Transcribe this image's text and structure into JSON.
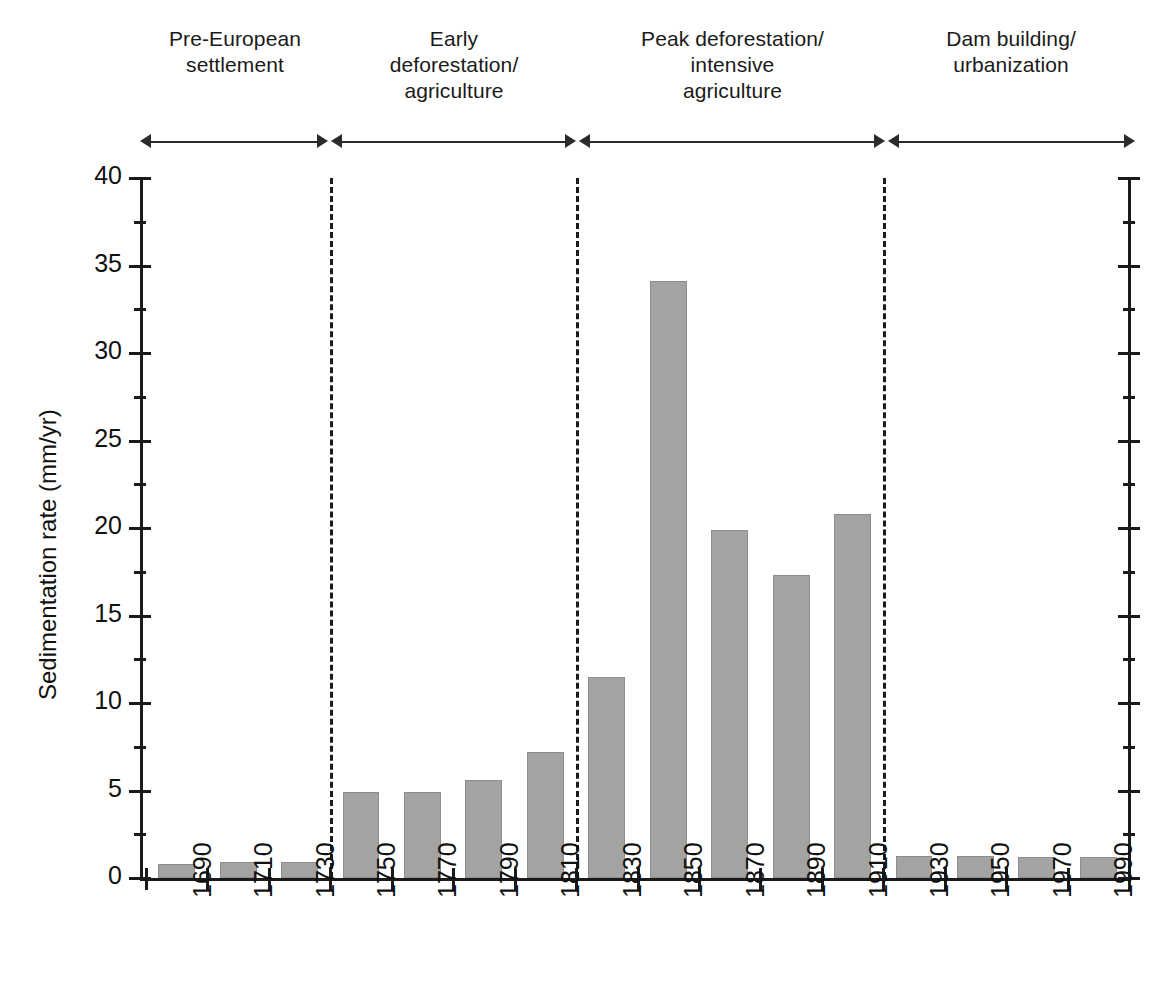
{
  "chart_data": {
    "type": "bar",
    "title": "",
    "xlabel": "",
    "ylabel": "Sedimentation rate (mm/yr)",
    "ylim": [
      0,
      40
    ],
    "ytick_values": [
      0,
      5,
      10,
      15,
      20,
      25,
      30,
      35,
      40
    ],
    "ytick_labels": [
      "0",
      "5",
      "10",
      "15",
      "20",
      "25",
      "30",
      "35",
      "40"
    ],
    "y_minor_tick_step": 2.5,
    "grid": false,
    "legend": null,
    "bar_color": "#a3a3a3",
    "categories": [
      "1690",
      "1710",
      "1730",
      "1750",
      "1770",
      "1790",
      "1810",
      "1830",
      "1850",
      "1870",
      "1890",
      "1910",
      "1930",
      "1950",
      "1970",
      "1990"
    ],
    "values": [
      0.8,
      0.9,
      0.9,
      4.9,
      4.9,
      5.6,
      7.2,
      11.5,
      34.1,
      19.9,
      17.3,
      20.8,
      1.25,
      1.25,
      1.2,
      1.2
    ],
    "annotations": {
      "eras": [
        {
          "label_lines": [
            "Pre-European",
            "settlement"
          ],
          "start_category": "1690",
          "end_category": "1730"
        },
        {
          "label_lines": [
            "Early",
            "deforestation/",
            "agriculture"
          ],
          "start_category": "1750",
          "end_category": "1810"
        },
        {
          "label_lines": [
            "Peak deforestation/",
            "intensive",
            "agriculture"
          ],
          "start_category": "1830",
          "end_category": "1910"
        },
        {
          "label_lines": [
            "Dam building/",
            "urbanization"
          ],
          "start_category": "1930",
          "end_category": "1990"
        }
      ],
      "divider_after_categories": [
        "1730",
        "1810",
        "1910"
      ]
    }
  },
  "icons": {
    "arrow_left": "arrow-left-icon",
    "arrow_right": "arrow-right-icon"
  }
}
